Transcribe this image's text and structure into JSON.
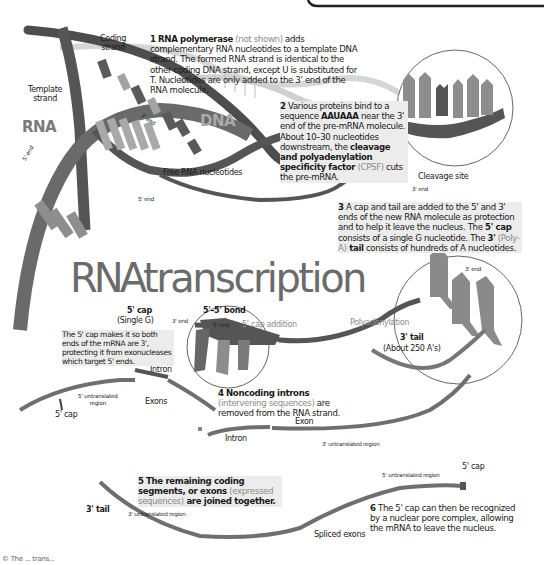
{
  "title": {
    "rna": "RNA",
    "rest": "transcription"
  },
  "labels": {
    "rna": "RNA",
    "dna": "DNA",
    "coding_strand": "Coding\nstrand",
    "template_strand": "Template\nstrand",
    "five_end_left": "5' end",
    "three_end_top": "3' end",
    "free_nucleotides": "Free RNA nucleotides",
    "five_end_mid": "5' end",
    "cleavage_site": "Cleavage site",
    "three_end_cleave": "3' end",
    "five_cap": "5' cap",
    "single_g": "(Single G)",
    "five_five_bond": "5'–5' bond",
    "cap_three_end": "3' end",
    "cap_five_end": "5' end",
    "cap_addition": "5' cap addition",
    "polyadenylation": "Polyadenylation",
    "tail_three_end": "3' end",
    "three_tail": "3' tail",
    "about_250": "(About 250 A's)",
    "intron_1": "Intron",
    "exons": "Exons",
    "utr5_left": "5' untranslated\nregion",
    "five_cap_left": "5' cap",
    "intron_2": "Intron",
    "exon": "Exon",
    "utr3_mid": "3' untranslated region",
    "three_tail_bottom": "3' tail",
    "utr3_bottom": "3' untranslated region",
    "utr5_bottom": "5' untranslated region",
    "five_cap_bottom": "5' cap",
    "spliced_exons": "Spliced exons",
    "footer": "© The ... trans..."
  },
  "nucleotides": {
    "circle_top": [
      "A",
      "A",
      "U",
      "A",
      "A",
      "A"
    ],
    "poly_a": [
      "A",
      "A",
      "A"
    ],
    "cap_g": "G"
  },
  "steps": [
    {
      "num": "1",
      "bold": "RNA polymerase",
      "grey": " (not shown)",
      "rest": " adds complementary RNA nucleotides to a template DNA strand. The formed RNA strand is identical to the other coding DNA strand, except U is substituted for T. Nucleotides are only added to the 3' end of the RNA molecule."
    },
    {
      "num": "2",
      "text_a": "Various proteins bind to a sequence ",
      "bold_a": "AAUAAA",
      "text_b": " near the 3' end of the pre-mRNA molecule. About 10–30 nucleotides downstream, the ",
      "bold_b": "cleavage and polyadenylation specificity factor",
      "grey": " (CPSF)",
      "text_c": " cuts the pre-mRNA."
    },
    {
      "num": "3",
      "text_a": "A cap and tail are added to the 5' and 3' ends of the new RNA molecule as protection and to help it leave the nucleus. The ",
      "bold_a": "5' cap",
      "text_b": " consists of a single G nucleotide. The ",
      "bold_b": "3'",
      "grey": " (Poly-A)",
      "bold_c": " tail",
      "text_c": " consists of hundreds of A nucleotides."
    },
    {
      "num": "4",
      "bold_a": "Noncoding introns",
      "grey": " (intervening sequences)",
      "text_a": " are removed from the RNA strand."
    },
    {
      "num": "5",
      "text_a": "The remaining coding segments, or ",
      "bold_a": "exons",
      "grey": " (expressed sequences)",
      "text_b": " are joined together."
    },
    {
      "num": "6",
      "text_a": "The 5' cap can then be recognized by a nuclear pore complex, allowing the mRNA to leave the nucleus."
    }
  ],
  "cap_note": "The 5' cap makes it so both ends of the mRNA are 3', protecting it  from exonucleases which target 5' ends.",
  "colors": {
    "strand_dark": "#4a4a4a",
    "strand_mid": "#6e6e6e",
    "nucleotide_light": "#9a9a9a",
    "highlight_bg": "#ececec",
    "title_grey": "#6b6b6b"
  }
}
